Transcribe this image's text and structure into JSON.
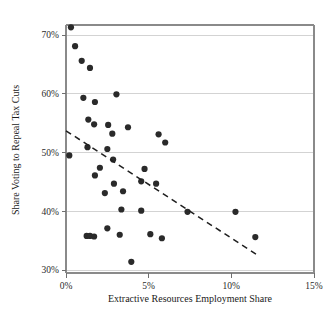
{
  "chart_data": {
    "type": "scatter",
    "title": "",
    "xlabel": "Extractive Resources Employment Share",
    "ylabel": "Share Voting to Repeal Tax Cuts",
    "xlim": [
      0,
      15
    ],
    "ylim": [
      30,
      71.5
    ],
    "xticks": [
      0,
      5,
      10,
      15
    ],
    "xtick_labels": [
      "0%",
      "5%",
      "10%",
      "15%"
    ],
    "yticks": [
      30,
      40,
      50,
      60,
      70
    ],
    "ytick_labels": [
      "30%",
      "40%",
      "50%",
      "60%",
      "70%"
    ],
    "grid": "horizontal",
    "legend": "none",
    "marker_color": "#2a2a2a",
    "grid_color": "#d3d3d3",
    "axis_color": "#8a8a8a",
    "trendline_color": "#1f1f1f",
    "points": [
      {
        "x": 0.3,
        "y": 71.3
      },
      {
        "x": 0.55,
        "y": 68.1
      },
      {
        "x": 0.95,
        "y": 65.6
      },
      {
        "x": 1.45,
        "y": 64.4
      },
      {
        "x": 1.05,
        "y": 59.3
      },
      {
        "x": 3.05,
        "y": 59.9
      },
      {
        "x": 1.75,
        "y": 58.6
      },
      {
        "x": 1.35,
        "y": 55.6
      },
      {
        "x": 1.7,
        "y": 54.8
      },
      {
        "x": 2.55,
        "y": 54.7
      },
      {
        "x": 3.75,
        "y": 54.3
      },
      {
        "x": 5.6,
        "y": 53.1
      },
      {
        "x": 2.8,
        "y": 53.2
      },
      {
        "x": 6.0,
        "y": 51.7
      },
      {
        "x": 1.3,
        "y": 50.9
      },
      {
        "x": 2.5,
        "y": 50.6
      },
      {
        "x": 0.2,
        "y": 49.5
      },
      {
        "x": 2.85,
        "y": 48.8
      },
      {
        "x": 2.05,
        "y": 47.4
      },
      {
        "x": 4.75,
        "y": 47.2
      },
      {
        "x": 1.75,
        "y": 46.1
      },
      {
        "x": 4.55,
        "y": 45.1
      },
      {
        "x": 2.9,
        "y": 44.7
      },
      {
        "x": 5.45,
        "y": 44.7
      },
      {
        "x": 3.45,
        "y": 43.4
      },
      {
        "x": 2.35,
        "y": 43.1
      },
      {
        "x": 3.35,
        "y": 40.3
      },
      {
        "x": 4.55,
        "y": 40.1
      },
      {
        "x": 7.35,
        "y": 39.9
      },
      {
        "x": 10.25,
        "y": 39.9
      },
      {
        "x": 2.5,
        "y": 37.1
      },
      {
        "x": 1.25,
        "y": 35.8
      },
      {
        "x": 1.45,
        "y": 35.8
      },
      {
        "x": 1.7,
        "y": 35.7
      },
      {
        "x": 3.25,
        "y": 36.0
      },
      {
        "x": 5.1,
        "y": 36.1
      },
      {
        "x": 5.8,
        "y": 35.4
      },
      {
        "x": 11.45,
        "y": 35.6
      },
      {
        "x": 3.95,
        "y": 31.4
      }
    ],
    "trendline": {
      "x_start": 0.0,
      "y_start": 53.7,
      "x_end": 11.6,
      "y_end": 32.5,
      "style": "dashed"
    }
  }
}
